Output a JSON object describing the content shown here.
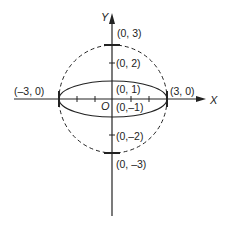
{
  "diagram": {
    "type": "geometry",
    "axes": {
      "x_label": "X",
      "y_label": "Y",
      "origin_label": "O"
    },
    "circle": {
      "center": [
        0,
        0
      ],
      "radius": 3,
      "style": "dashed"
    },
    "ellipse": {
      "center": [
        0,
        0
      ],
      "semi_major": 3,
      "semi_minor": 1,
      "style": "solid"
    },
    "points": {
      "p_0_3": "(0, 3)",
      "p_0_2": "(0, 2)",
      "p_0_1": "(0, 1)",
      "p_0_m1": "(0,–1)",
      "p_0_m2": "(0,–2)",
      "p_0_m3": "(0, –3)",
      "p_m3_0": "(–3, 0)",
      "p_3_0": "(3, 0)"
    }
  }
}
